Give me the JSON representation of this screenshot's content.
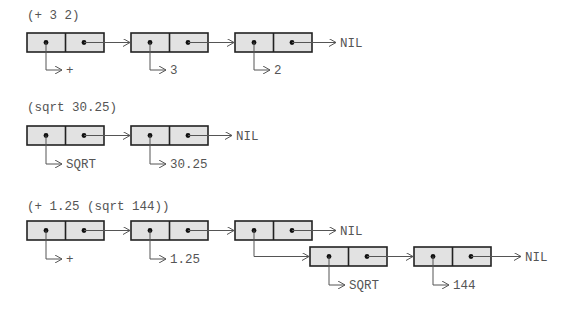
{
  "diagram": {
    "colors": {
      "cell_fill": "#e2e2e2",
      "cell_border": "#222222",
      "text": "#555555",
      "pointer": "#555555"
    },
    "expressions": [
      {
        "source": "(+ 3 2)",
        "cells": [
          {
            "car": "+",
            "cdr": "next"
          },
          {
            "car": "3",
            "cdr": "next"
          },
          {
            "car": "2",
            "cdr": "NIL"
          }
        ]
      },
      {
        "source": "(sqrt 30.25)",
        "cells": [
          {
            "car": "SQRT",
            "cdr": "next"
          },
          {
            "car": "30.25",
            "cdr": "NIL"
          }
        ]
      },
      {
        "source": "(+ 1.25 (sqrt 144))",
        "cells": [
          {
            "car": "+",
            "cdr": "next"
          },
          {
            "car": "1.25",
            "cdr": "next"
          },
          {
            "car": "sublist",
            "cdr": "NIL"
          }
        ],
        "sublist": [
          {
            "car": "SQRT",
            "cdr": "next"
          },
          {
            "car": "144",
            "cdr": "NIL"
          }
        ]
      }
    ],
    "nil_label": "NIL"
  }
}
